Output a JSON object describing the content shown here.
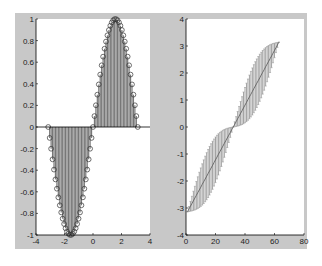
{
  "figure": {
    "background": "#c8c8c8",
    "plot_background": "#ffffff",
    "line_color": "#555555",
    "caption": ""
  },
  "chart_data": [
    {
      "type": "stem",
      "title": "",
      "xlabel": "",
      "ylabel": "",
      "xlim": [
        -4,
        4
      ],
      "ylim": [
        -1,
        1
      ],
      "xticks": [
        -4,
        -2,
        0,
        2,
        4
      ],
      "yticks": [
        -1,
        -0.8,
        -0.6,
        -0.4,
        -0.2,
        0,
        0.2,
        0.4,
        0.6,
        0.8,
        1
      ],
      "ytick_labels": [
        "-1",
        "-0.8",
        "-0.6",
        "-0.4",
        "-0.2",
        "0",
        "0.2",
        "0.4",
        "0.6",
        "0.8",
        "1"
      ],
      "grid": false,
      "function": "sin(x)",
      "x_range": [
        -3.14159,
        3.14159
      ],
      "n_points": 63,
      "marker": "circle",
      "baseline": 0
    },
    {
      "type": "errorbar",
      "title": "",
      "xlabel": "",
      "ylabel": "",
      "xlim": [
        0,
        80
      ],
      "ylim": [
        -4,
        4
      ],
      "xticks": [
        0,
        20,
        40,
        60,
        80
      ],
      "yticks": [
        -4,
        -3,
        -2,
        -1,
        0,
        1,
        2,
        3,
        4
      ],
      "grid": false,
      "center_line": "y = x from -pi to pi over indices 1..63",
      "error": "band envelope follows y +/- (sin-shaped deviation)",
      "n_points": 63,
      "y_start": -3.14,
      "y_end": 3.14
    }
  ]
}
